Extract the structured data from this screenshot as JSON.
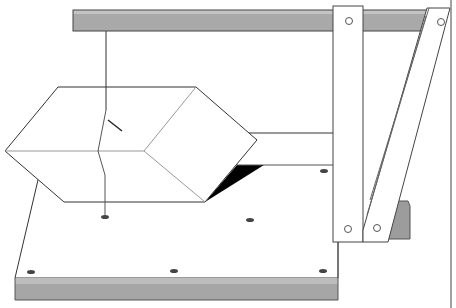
{
  "figure": {
    "title": "",
    "description": "Line illustration of a rhombohedral crystal suspended by a thread from a horizontal bar above a base board with dowel holes; a vertical post and a diagonal brace support the bar at right.",
    "colors": {
      "background": "#ffffff",
      "line": "#333333",
      "bar_fill": "#a9a9a9",
      "bar_top": "#c4c4c4",
      "board_side": "#a6a6a6",
      "board_edge": "#b8b8b8",
      "shadow": "#000000",
      "block": "#9c9c9c"
    },
    "parts": [
      {
        "name": "top-bar"
      },
      {
        "name": "suspension-thread"
      },
      {
        "name": "rhombohedral-crystal"
      },
      {
        "name": "crystal-shadow"
      },
      {
        "name": "base-board"
      },
      {
        "name": "vertical-post"
      },
      {
        "name": "diagonal-brace"
      },
      {
        "name": "support-block"
      },
      {
        "name": "holes"
      }
    ]
  }
}
